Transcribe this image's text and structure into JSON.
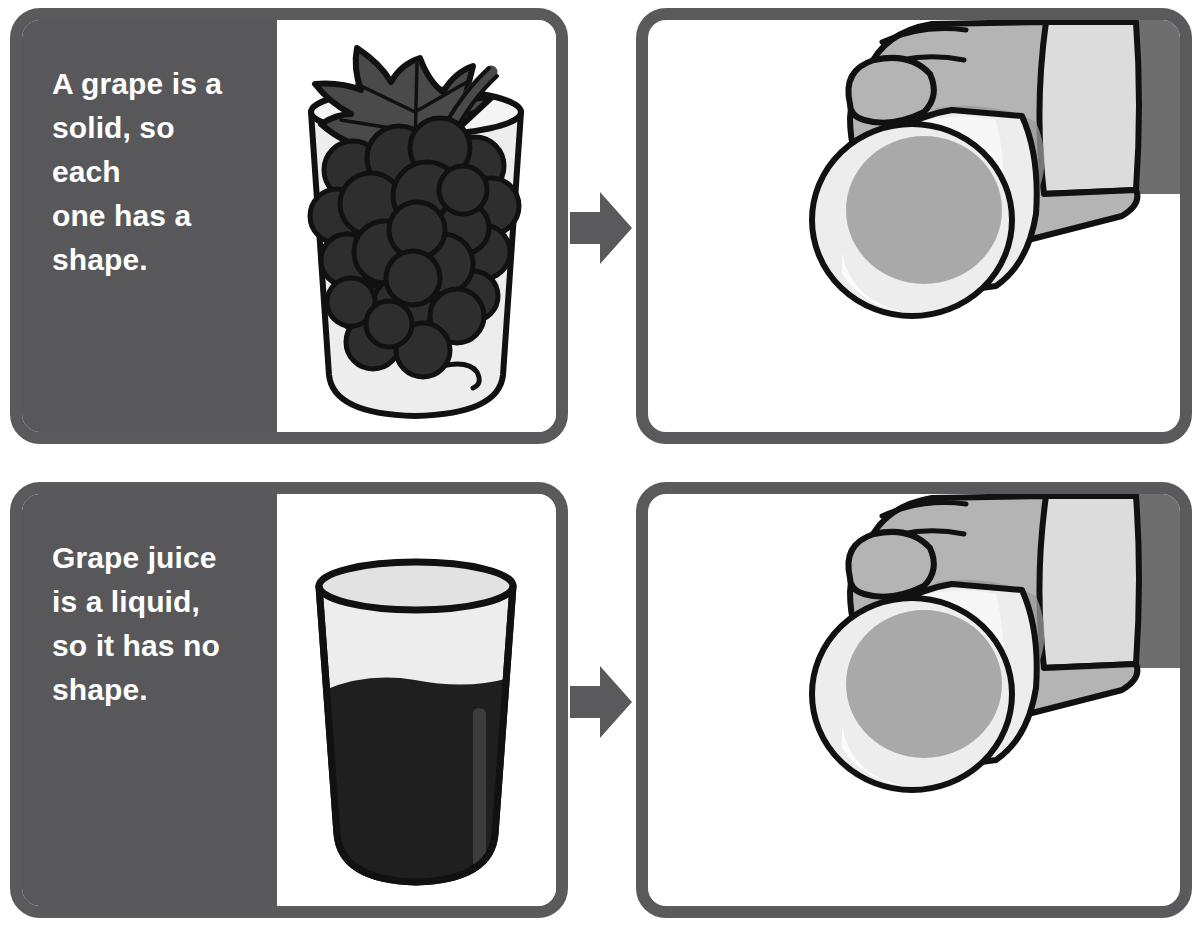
{
  "page": {
    "background_color": "#ffffff"
  },
  "colors": {
    "panel_gray": "#58585a",
    "border_gray": "#5a5a5c",
    "arrow_gray": "#5a5a5c",
    "text_white": "#ffffff",
    "grape_dark": "#2e2e2e",
    "leaf_gray": "#4a4a4a",
    "juice_dark": "#1f1f1f",
    "glass_light": "#ededed",
    "hand_gray": "#b4b4b4",
    "hand_shadow": "#9a9a9a",
    "sleeve_light": "#dcdcdc",
    "sleeve_dark": "#6e6e6e",
    "outline_black": "#111111"
  },
  "rows": [
    {
      "id": "solid",
      "caption_lines": [
        "A grape is a",
        "solid, so each",
        "one has a",
        "shape."
      ],
      "caption_text": "A grape is a solid, so each one has a shape.",
      "left_image": {
        "name": "grapes-in-glass-illustration",
        "description": "Bunch of dark grapes with a leaf and stem inside a clear drinking glass"
      },
      "arrow": {
        "name": "right-arrow",
        "glyph": "▶",
        "direction": "right"
      },
      "right_image": {
        "name": "hand-tipping-glass-with-grapes-illustration",
        "description": "A hand tipping the glass sideways; the grapes keep their shape"
      }
    },
    {
      "id": "liquid",
      "caption_lines": [
        "Grape juice",
        "is a liquid,",
        "so it has no",
        "shape."
      ],
      "caption_text": "Grape juice is a liquid, so it has no shape.",
      "left_image": {
        "name": "grape-juice-in-glass-illustration",
        "description": "Glass filled about two thirds with dark purple grape juice"
      },
      "arrow": {
        "name": "right-arrow",
        "glyph": "▶",
        "direction": "right"
      },
      "right_image": {
        "name": "hand-tipping-glass-with-juice-illustration",
        "description": "A hand tipping the glass sideways; the juice takes the new shape"
      }
    }
  ]
}
